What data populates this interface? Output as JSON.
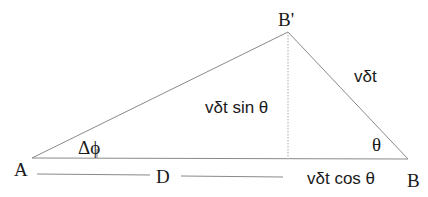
{
  "diagram": {
    "vertices": {
      "A": {
        "label": "A"
      },
      "B_prime": {
        "label": "B'"
      },
      "B": {
        "label": "B"
      }
    },
    "labels": {
      "angle_phi": "Δϕ",
      "angle_theta": "θ",
      "hypotenuse": "vδt",
      "opposite": "vδt sin θ",
      "adjacent": "vδt cos θ",
      "distance": "D"
    },
    "colors": {
      "line": "#8a8a8a",
      "text": "#1a1a1a",
      "background": "#ffffff"
    }
  }
}
